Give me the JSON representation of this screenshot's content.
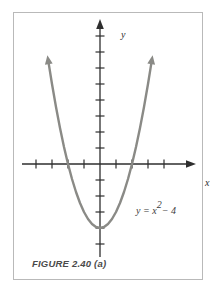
{
  "figure": {
    "caption": "FIGURE 2.40 (a)",
    "equation_label": {
      "full": "y = x² − 4",
      "lhs": "y",
      "equals": "=",
      "base": "x",
      "exponent": "2",
      "tail": "− 4"
    },
    "axis_labels": {
      "x": "x",
      "y": "y"
    },
    "frame_color": "#b9b9b9",
    "background_color": "#ffffff",
    "axis_color": "#2e2e2e",
    "curve_color": "#8a8a86",
    "caption_color": "#4a4a4a"
  },
  "chart_data": {
    "type": "line",
    "title": "FIGURE 2.40 (a)",
    "xlabel": "x",
    "ylabel": "y",
    "annotations": [
      "y = x² − 4"
    ],
    "grid": false,
    "legend": "none",
    "xlim": [
      -5,
      5
    ],
    "ylim": [
      -5.5,
      7
    ],
    "x_ticks": [
      -4,
      -3,
      -2,
      -1,
      1,
      2,
      3,
      4
    ],
    "y_ticks": [
      -5,
      -4,
      -3,
      -2,
      -1,
      1,
      2,
      3,
      4,
      5,
      6
    ],
    "tick_labels_shown": false,
    "axis_arrows": [
      "x-positive",
      "y-positive"
    ],
    "curve_arrows": [
      "left-branch-up",
      "right-branch-up"
    ],
    "series": [
      {
        "name": "y = x² - 4",
        "expression": "y = x^2 - 4",
        "vertex": [
          0,
          -4
        ],
        "roots": [
          -2,
          2
        ],
        "y_intercept": -4,
        "x": [
          -3.2,
          -3.0,
          -2.75,
          -2.5,
          -2.25,
          -2.0,
          -1.75,
          -1.5,
          -1.25,
          -1.0,
          -0.75,
          -0.5,
          -0.25,
          0,
          0.25,
          0.5,
          0.75,
          1.0,
          1.25,
          1.5,
          1.75,
          2.0,
          2.25,
          2.5,
          2.75,
          3.0,
          3.2
        ],
        "y": [
          6.24,
          5.0,
          3.5625,
          2.25,
          1.0625,
          0,
          -0.9375,
          -1.75,
          -2.4375,
          -3.0,
          -3.4375,
          -3.75,
          -3.9375,
          -4.0,
          -3.9375,
          -3.75,
          -3.4375,
          -3.0,
          -2.4375,
          -1.75,
          -0.9375,
          0,
          1.0625,
          2.25,
          3.5625,
          5.0,
          6.24
        ]
      }
    ]
  }
}
